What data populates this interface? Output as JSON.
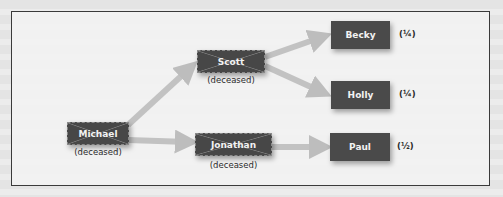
{
  "diagram": {
    "type": "inheritance-tree",
    "colors": {
      "node_fill": "#474747",
      "node_text": "#f2f2f2",
      "arrow": "#bdbdbd",
      "frame_border": "#3a3a3a",
      "background": "#ececec"
    },
    "nodes": {
      "michael": {
        "name": "Michael",
        "status": "(deceased)"
      },
      "scott": {
        "name": "Scott",
        "status": "(deceased)"
      },
      "jonathan": {
        "name": "Jonathan",
        "status": "(deceased)"
      },
      "becky": {
        "name": "Becky",
        "share": "(¼)"
      },
      "holly": {
        "name": "Holly",
        "share": "(¼)"
      },
      "paul": {
        "name": "Paul",
        "share": "(½)"
      }
    },
    "edges": [
      {
        "from": "Michael",
        "to": "Scott"
      },
      {
        "from": "Michael",
        "to": "Jonathan"
      },
      {
        "from": "Scott",
        "to": "Becky"
      },
      {
        "from": "Scott",
        "to": "Holly"
      },
      {
        "from": "Jonathan",
        "to": "Paul"
      }
    ]
  }
}
